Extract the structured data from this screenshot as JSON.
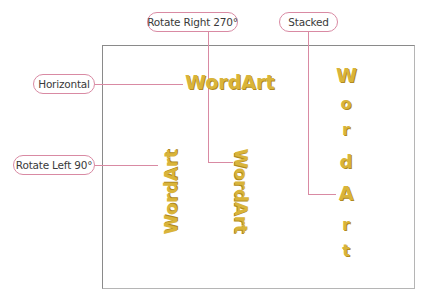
{
  "callouts": {
    "horizontal": "Horizontal",
    "rotate_right": "Rotate Right 270°",
    "stacked": "Stacked",
    "rotate_left": "Rotate Left 90°"
  },
  "wordart": {
    "horizontal": "WordArt",
    "rotate_left": "WordArt",
    "rotate_right": "WordArt",
    "stacked": [
      "W",
      "o",
      "r",
      "d",
      "A",
      "r",
      "t"
    ]
  },
  "colors": {
    "wordart_fill": "#d9b43a",
    "callout_border": "#d98aa3",
    "frame_border": "#8a8a8a"
  }
}
